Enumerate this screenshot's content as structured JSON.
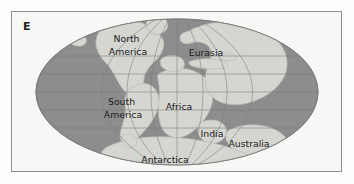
{
  "figure": {
    "panel_letter": "E",
    "caption_text": ""
  },
  "colors": {
    "page_background": "#ffffff",
    "panel_background": "#f7f7f5",
    "frame_border": "#8d8d8d",
    "ocean": "#8e8e8e",
    "ocean_edge": "#7d7d7d",
    "land": "#d6d6d2",
    "land_edge": "#bcbcb8",
    "graticule": "#7a7a7a",
    "label_text": "#20201f"
  },
  "map": {
    "projection": "mollweide-ellipse",
    "ellipse": {
      "cx": 166,
      "cy": 81,
      "rx": 141,
      "ry": 73
    },
    "graticule": {
      "meridian_count": 7,
      "parallel_count": 5,
      "visible": true
    },
    "labels": [
      {
        "name": "north-america",
        "text": "North America",
        "x": 117,
        "y": 34,
        "lines": [
          "North",
          "America"
        ]
      },
      {
        "name": "eurasia",
        "text": "Eurasia",
        "x": 195,
        "y": 42,
        "lines": [
          "Eurasia"
        ]
      },
      {
        "name": "south-america",
        "text": "South America",
        "x": 112,
        "y": 97,
        "lines": [
          "South",
          "America"
        ]
      },
      {
        "name": "africa",
        "text": "Africa",
        "x": 166,
        "y": 96,
        "lines": [
          "Africa"
        ]
      },
      {
        "name": "india",
        "text": "India",
        "x": 201,
        "y": 123,
        "lines": [
          "India"
        ]
      },
      {
        "name": "australia",
        "text": "Australia",
        "x": 237,
        "y": 131,
        "lines": [
          "Australia"
        ]
      },
      {
        "name": "antarctica",
        "text": "Antarctica",
        "x": 154,
        "y": 148,
        "lines": [
          "Antarctica"
        ]
      }
    ]
  }
}
